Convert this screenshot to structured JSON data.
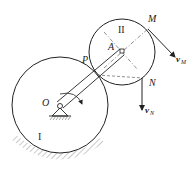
{
  "diagram": {
    "title": "",
    "labels": {
      "O": "O",
      "A": "A",
      "P": "P",
      "M": "M",
      "N": "N",
      "gear_I": "I",
      "gear_II": "II",
      "vM_main": "v",
      "vM_sub": "M",
      "vN_main": "v",
      "vN_sub": "N"
    },
    "elements": [
      "fixed-gear-I",
      "moving-gear-II",
      "crank-OA",
      "pivot-support-O",
      "ground-hatching",
      "velocity-vector-vM",
      "velocity-vector-vN",
      "rotation-arrow"
    ],
    "colors": {
      "stroke": "#222222",
      "hatch": "#777777",
      "background": "#ffffff"
    }
  }
}
